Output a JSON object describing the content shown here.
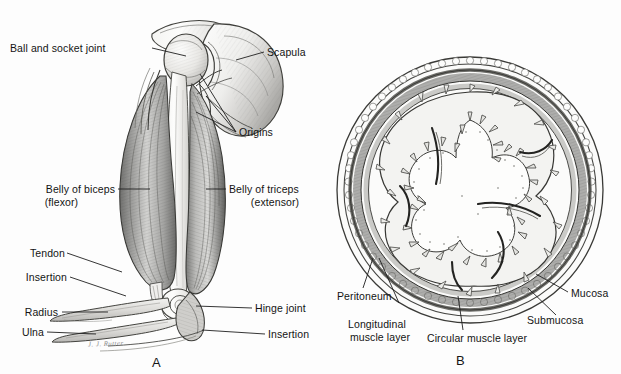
{
  "figure": {
    "background_color": "#fdfdfd",
    "ink_color": "#2a2a2a",
    "panels": [
      {
        "letter": "A",
        "caption": "Arm showing antagonistic muscles and joints"
      },
      {
        "letter": "B",
        "caption": "Transverse section through the intestine"
      }
    ]
  },
  "panel_a": {
    "letter": "A",
    "labels": [
      {
        "id": "ball-and-socket-joint",
        "text": "Ball and socket joint"
      },
      {
        "id": "scapula",
        "text": "Scapula"
      },
      {
        "id": "origins",
        "text": "Origins"
      },
      {
        "id": "belly-of-biceps",
        "text": "Belly of biceps"
      },
      {
        "id": "belly-of-biceps-sub",
        "text": "(flexor)"
      },
      {
        "id": "belly-of-triceps",
        "text": "Belly of triceps"
      },
      {
        "id": "belly-of-triceps-sub",
        "text": "(extensor)"
      },
      {
        "id": "tendon",
        "text": "Tendon"
      },
      {
        "id": "insertion-left",
        "text": "Insertion"
      },
      {
        "id": "radius",
        "text": "Radius"
      },
      {
        "id": "ulna",
        "text": "Ulna"
      },
      {
        "id": "hinge-joint",
        "text": "Hinge joint"
      },
      {
        "id": "insertion-right",
        "text": "Insertion"
      }
    ],
    "signature": "J. J. Rutter"
  },
  "panel_b": {
    "letter": "B",
    "labels": [
      {
        "id": "peritoneum",
        "text": "Peritoneum"
      },
      {
        "id": "longitudinal-muscle-layer-1",
        "text": "Longitudinal"
      },
      {
        "id": "longitudinal-muscle-layer-2",
        "text": "muscle layer"
      },
      {
        "id": "circular-muscle-layer",
        "text": "Circular muscle layer"
      },
      {
        "id": "mucosa",
        "text": "Mucosa"
      },
      {
        "id": "submucosa",
        "text": "Submucosa"
      }
    ]
  }
}
